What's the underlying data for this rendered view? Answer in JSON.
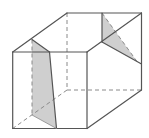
{
  "diagram": {
    "type": "3d-prism-cross-sections",
    "colors": {
      "edge": "#555555",
      "hidden_edge": "#8a8a8a",
      "shade": "#cfcfcf",
      "background": "#ffffff"
    },
    "vertices": {
      "front_top_left": [
        12.7,
        52
      ],
      "front_top_right": [
        87,
        52
      ],
      "front_bottom_right": [
        87,
        128.5
      ],
      "front_bottom_left": [
        12.7,
        128.5
      ],
      "back_top_left": [
        67,
        13
      ],
      "back_top_right": [
        141.5,
        13
      ],
      "back_bottom_right": [
        141.5,
        90
      ],
      "back_bottom_left": [
        67,
        90
      ],
      "left_apex": [
        32,
        39.5
      ],
      "left_section_top_right": [
        49.5,
        52
      ],
      "left_section_bottom_right": [
        56.5,
        128.5
      ],
      "left_section_bottom_left": [
        32,
        115
      ],
      "right_top": [
        102,
        13
      ],
      "right_mid": [
        102,
        42
      ],
      "right_side_point": [
        141.5,
        64
      ],
      "right_section_tip": [
        137,
        61.5
      ]
    },
    "shaded_regions": [
      {
        "name": "left-section",
        "points": [
          [
            32,
            39.5
          ],
          [
            49.5,
            52
          ],
          [
            56.5,
            128.5
          ],
          [
            32,
            115
          ]
        ]
      },
      {
        "name": "right-section",
        "points": [
          [
            102,
            13
          ],
          [
            102,
            42
          ],
          [
            137,
            61.5
          ]
        ]
      }
    ]
  }
}
